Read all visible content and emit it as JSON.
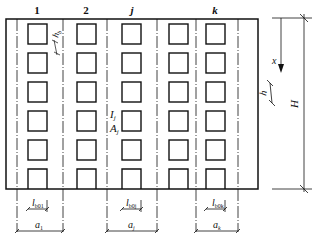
{
  "diagram": {
    "type": "shear-wall-with-openings",
    "column_labels": [
      "1",
      "2",
      "j",
      "k"
    ],
    "opening_rows": 6,
    "labels": {
      "story_height": "h",
      "wall_height": "H",
      "depth_coord": "x",
      "opening_height": "h",
      "inertia": "I",
      "inertia_sub": "j",
      "area": "A",
      "area_sub": "j",
      "hb": "h",
      "hb_sub": "b"
    },
    "bottom_dims": [
      {
        "lb": "l",
        "lb_sub": "b01",
        "a": "a",
        "a_sub": "1"
      },
      {
        "lb": "l",
        "lb_sub": "b0j",
        "a": "a",
        "a_sub": "j"
      },
      {
        "lb": "l",
        "lb_sub": "b0k",
        "a": "a",
        "a_sub": "k"
      }
    ],
    "colors": {
      "line": "#111111",
      "background": "#ffffff"
    }
  }
}
